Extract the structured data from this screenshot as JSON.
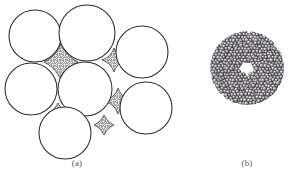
{
  "figure": {
    "background_color": "#ffffff",
    "ink_color": "#2b2a2e",
    "caption_color": "#59565a",
    "fine_particle_color": "#4a484c",
    "fine_particle_highlight": "#f2f1ef",
    "panels": [
      {
        "id": "a",
        "caption": "(a)",
        "caption_x": 77,
        "caption_y": 166,
        "description": "coarse spheres in close packing with fine particles filling interstitial voids",
        "coarse_particles": [
          {
            "cx": 35,
            "cy": 36,
            "r": 26
          },
          {
            "cx": 87,
            "cy": 33,
            "r": 28
          },
          {
            "cx": 142,
            "cy": 52,
            "r": 26
          },
          {
            "cx": 31,
            "cy": 89,
            "r": 26
          },
          {
            "cx": 85,
            "cy": 89,
            "r": 27
          },
          {
            "cx": 146,
            "cy": 108,
            "r": 26
          },
          {
            "cx": 65,
            "cy": 133,
            "r": 26
          }
        ],
        "interstitial_voids": [
          {
            "cx": 61,
            "cy": 62,
            "rx": 17,
            "ry": 18,
            "rot": 0
          },
          {
            "cx": 114,
            "cy": 60,
            "rx": 13,
            "ry": 13,
            "rot": 12
          },
          {
            "cx": 118,
            "cy": 101,
            "rx": 13,
            "ry": 14,
            "rot": -6
          },
          {
            "cx": 58,
            "cy": 113,
            "rx": 11,
            "ry": 11,
            "rot": 18
          },
          {
            "cx": 104,
            "cy": 124,
            "rx": 12,
            "ry": 11,
            "rot": -24
          }
        ]
      },
      {
        "id": "b",
        "caption": "(b)",
        "caption_x": 247,
        "caption_y": 166,
        "description": "single coarse particle fully coated by a dense layer of fine particles",
        "core": {
          "cx": 247,
          "cy": 68,
          "r": 24
        },
        "coating": {
          "cx": 247,
          "cy": 68,
          "inner_r": 12,
          "outer_r": 37
        }
      }
    ]
  }
}
